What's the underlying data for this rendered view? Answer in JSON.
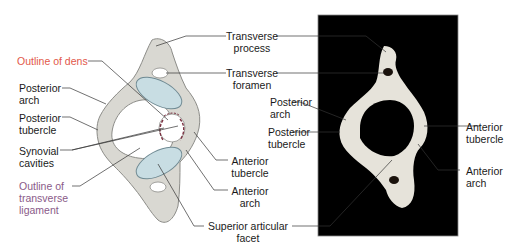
{
  "figure": {
    "colors": {
      "bone": "#d9d8d2",
      "bone_outline": "#8c8c88",
      "facet": "#c8dde3",
      "facet_outline": "#6f8a93",
      "leader_line": "#333333",
      "photo_background": "#000000",
      "photo_bone": "#e6e3da",
      "dens_label": "#e2584a",
      "ligament_label": "#8a5a88",
      "synovial": "#7a3040"
    }
  },
  "illustration": {
    "labels": {
      "outline_of_dens": "Outline of dens",
      "posterior_arch_1": "Posterior",
      "posterior_arch_2": "arch",
      "posterior_tubercle_1": "Posterior",
      "posterior_tubercle_2": "tubercle",
      "synovial_cavities_1": "Synovial",
      "synovial_cavities_2": "cavities",
      "outline_transverse_ligament_1": "Outline of",
      "outline_transverse_ligament_2": "transverse",
      "outline_transverse_ligament_3": "ligament",
      "anterior_tubercle_1": "Anterior",
      "anterior_tubercle_2": "tubercle",
      "anterior_arch_1": "Anterior",
      "anterior_arch_2": "arch"
    }
  },
  "shared_labels": {
    "transverse_process_1": "Transverse",
    "transverse_process_2": "process",
    "transverse_foramen_1": "Transverse",
    "transverse_foramen_2": "foramen",
    "superior_articular_facet_1": "Superior articular",
    "superior_articular_facet_2": "facet"
  },
  "photograph": {
    "labels": {
      "posterior_arch_1": "Posterior",
      "posterior_arch_2": "arch",
      "posterior_tubercle_1": "Posterior",
      "posterior_tubercle_2": "tubercle",
      "anterior_tubercle_1": "Anterior",
      "anterior_tubercle_2": "tubercle",
      "anterior_arch_1": "Anterior",
      "anterior_arch_2": "arch"
    }
  }
}
